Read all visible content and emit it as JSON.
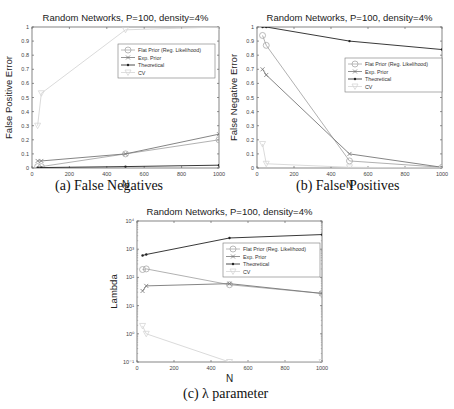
{
  "chart_data": [
    {
      "id": "a",
      "type": "line",
      "title": "Random Networks, P=100, density=4%",
      "xlabel": "N",
      "ylabel": "False Positive Error",
      "caption": "(a) False Negatives",
      "xlim": [
        0,
        1000
      ],
      "ylim": [
        0,
        1
      ],
      "yscale": "linear",
      "xticks": [
        0,
        200,
        400,
        600,
        800,
        1000
      ],
      "yticks": [
        0,
        0.1,
        0.2,
        0.3,
        0.4,
        0.5,
        0.6,
        0.7,
        0.8,
        0.9,
        1
      ],
      "ytick_labels": [
        "0",
        "0.1",
        "0.2",
        "0.3",
        "0.4",
        "0.5",
        "0.6",
        "0.7",
        "0.8",
        "0.9",
        "1"
      ],
      "grid": false,
      "legend_position": "upper right",
      "x": [
        30,
        50,
        500,
        1000
      ],
      "series": [
        {
          "name": "Flat Prior (Reg. Likelihood)",
          "marker": "circle",
          "color": "#a8a8a8",
          "values": [
            0.01,
            0.01,
            0.1,
            0.2
          ]
        },
        {
          "name": "Exp. Prior",
          "marker": "x",
          "color": "#777777",
          "values": [
            0.05,
            0.05,
            0.1,
            0.24
          ]
        },
        {
          "name": "Theoretical",
          "marker": "dot",
          "color": "#222222",
          "values": [
            0.002,
            0.003,
            0.01,
            0.02
          ]
        },
        {
          "name": "CV",
          "marker": "triangle",
          "color": "#d6d6d6",
          "values": [
            0.3,
            0.53,
            0.98,
            1.0
          ]
        }
      ]
    },
    {
      "id": "b",
      "type": "line",
      "title": "Random Networks, P=100, density=4%",
      "xlabel": "N",
      "ylabel": "False Negative Error",
      "caption": "(b) False Positives",
      "xlim": [
        0,
        1000
      ],
      "ylim": [
        0,
        1
      ],
      "yscale": "linear",
      "xticks": [
        0,
        200,
        400,
        600,
        800,
        1000
      ],
      "yticks": [
        0,
        0.1,
        0.2,
        0.3,
        0.4,
        0.5,
        0.6,
        0.7,
        0.8,
        0.9,
        1
      ],
      "ytick_labels": [
        "0",
        "0.1",
        "0.2",
        "0.3",
        "0.4",
        "0.5",
        "0.6",
        "0.7",
        "0.8",
        "0.9",
        "1"
      ],
      "grid": false,
      "legend_position": "upper right",
      "x": [
        30,
        50,
        500,
        1000
      ],
      "series": [
        {
          "name": "Flat Prior (Reg. Likelihood)",
          "marker": "circle",
          "color": "#a8a8a8",
          "values": [
            0.94,
            0.87,
            0.05,
            0.005
          ]
        },
        {
          "name": "Exp. Prior",
          "marker": "x",
          "color": "#777777",
          "values": [
            0.7,
            0.66,
            0.1,
            0.005
          ]
        },
        {
          "name": "Theoretical",
          "marker": "dot",
          "color": "#222222",
          "values": [
            1.0,
            1.0,
            0.9,
            0.84
          ]
        },
        {
          "name": "CV",
          "marker": "triangle",
          "color": "#d6d6d6",
          "values": [
            0.17,
            0.03,
            0.005,
            0.0
          ]
        }
      ]
    },
    {
      "id": "c",
      "type": "line",
      "title": "Random Networks, P=100, density=4%",
      "xlabel": "N",
      "ylabel": "Lambda",
      "caption": "(c) λ parameter",
      "xlim": [
        0,
        1000
      ],
      "ylim": [
        0.1,
        10000
      ],
      "yscale": "log",
      "xticks": [
        0,
        200,
        400,
        600,
        800,
        1000
      ],
      "yticks": [
        0.1,
        1,
        10,
        100,
        1000,
        10000
      ],
      "ytick_labels": [
        "10⁻¹",
        "10⁰",
        "10¹",
        "10²",
        "10³",
        "10⁴"
      ],
      "grid": false,
      "legend_position": "upper right",
      "x": [
        30,
        50,
        500,
        1000
      ],
      "series": [
        {
          "name": "Flat Prior (Reg. Likelihood)",
          "marker": "circle",
          "color": "#a8a8a8",
          "values": [
            190,
            200,
            55,
            27
          ]
        },
        {
          "name": "Exp. Prior",
          "marker": "x",
          "color": "#777777",
          "values": [
            33,
            50,
            60,
            27
          ]
        },
        {
          "name": "Theoretical",
          "marker": "dot",
          "color": "#222222",
          "values": [
            600,
            650,
            2500,
            3300
          ]
        },
        {
          "name": "CV",
          "marker": "triangle",
          "color": "#d6d6d6",
          "values": [
            1.9,
            1.0,
            0.1,
            0.1
          ]
        }
      ]
    }
  ]
}
